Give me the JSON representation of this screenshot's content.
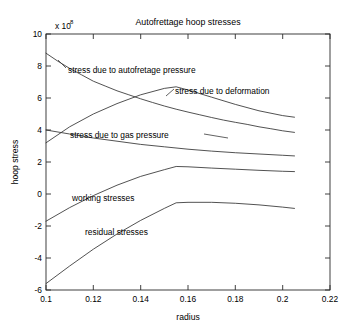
{
  "chart_data": {
    "type": "line",
    "title": "Autofrettage hoop stresses",
    "xlabel": "radius",
    "ylabel": "hoop stress",
    "y_multiplier": "x 10",
    "y_exponent": "8",
    "xlim": [
      0.1,
      0.22
    ],
    "ylim": [
      -6,
      10
    ],
    "xticks": [
      0.1,
      0.12,
      0.14,
      0.16,
      0.18,
      0.2,
      0.22
    ],
    "xticklabels": [
      "0.1",
      "0.12",
      "0.14",
      "0.16",
      "0.18",
      "0.2",
      "0.22"
    ],
    "yticks": [
      -6,
      -4,
      -2,
      0,
      2,
      4,
      6,
      8,
      10
    ],
    "yticklabels": [
      "-6",
      "-4",
      "-2",
      "0",
      "2",
      "4",
      "6",
      "8",
      "10"
    ],
    "grid": false,
    "legend": "inline-annotations",
    "series": [
      {
        "name": "stress due to autofretage pressure",
        "label": "stress due to autofretage pressure",
        "x": [
          0.1,
          0.105,
          0.11,
          0.115,
          0.12,
          0.125,
          0.13,
          0.135,
          0.14,
          0.145,
          0.15,
          0.155,
          0.16,
          0.165,
          0.17,
          0.175,
          0.18,
          0.185,
          0.19,
          0.195,
          0.2,
          0.205
        ],
        "y": [
          8.8,
          8.3,
          7.85,
          7.45,
          7.05,
          6.75,
          6.45,
          6.2,
          5.95,
          5.72,
          5.5,
          5.3,
          5.12,
          4.95,
          4.78,
          4.62,
          4.48,
          4.35,
          4.2,
          4.08,
          3.95,
          3.85
        ]
      },
      {
        "name": "stress due to deformation",
        "label": "stress due to deformation",
        "x": [
          0.1,
          0.11,
          0.12,
          0.13,
          0.14,
          0.15,
          0.155,
          0.16,
          0.17,
          0.18,
          0.19,
          0.2,
          0.205
        ],
        "y": [
          3.2,
          4.2,
          5.0,
          5.65,
          6.2,
          6.6,
          6.7,
          6.5,
          6.05,
          5.6,
          5.2,
          4.9,
          4.8
        ]
      },
      {
        "name": "stress due to gas pressure",
        "label": "stress due to gas pressure",
        "x": [
          0.1,
          0.11,
          0.12,
          0.13,
          0.14,
          0.15,
          0.16,
          0.17,
          0.18,
          0.19,
          0.2,
          0.205
        ],
        "y": [
          4.0,
          3.75,
          3.5,
          3.3,
          3.1,
          2.95,
          2.8,
          2.68,
          2.58,
          2.5,
          2.42,
          2.38
        ]
      },
      {
        "name": "working stresses",
        "label": "working stresses",
        "x": [
          0.1,
          0.11,
          0.12,
          0.13,
          0.14,
          0.15,
          0.155,
          0.16,
          0.17,
          0.18,
          0.19,
          0.2,
          0.205
        ],
        "y": [
          -1.7,
          -0.85,
          -0.1,
          0.55,
          1.1,
          1.52,
          1.72,
          1.7,
          1.62,
          1.55,
          1.48,
          1.42,
          1.4
        ]
      },
      {
        "name": "residual stresses",
        "label": "residual stresses",
        "x": [
          0.1,
          0.11,
          0.12,
          0.13,
          0.14,
          0.15,
          0.155,
          0.16,
          0.17,
          0.18,
          0.19,
          0.2,
          0.205
        ],
        "y": [
          -5.6,
          -4.5,
          -3.45,
          -2.5,
          -1.65,
          -0.9,
          -0.55,
          -0.52,
          -0.52,
          -0.58,
          -0.68,
          -0.82,
          -0.9
        ]
      }
    ],
    "annotations": [
      {
        "text": "stress due to autofretage pressure",
        "x_px": 68,
        "y_px": 70
      },
      {
        "text": "stress due to deformation",
        "x_px": 175,
        "y_px": 91
      },
      {
        "text": "stress due to gas pressure",
        "x_px": 70,
        "y_px": 135
      },
      {
        "text": "working stresses",
        "x_px": 72,
        "y_px": 198
      },
      {
        "text": "residual stresses",
        "x_px": 85,
        "y_px": 232
      }
    ]
  }
}
